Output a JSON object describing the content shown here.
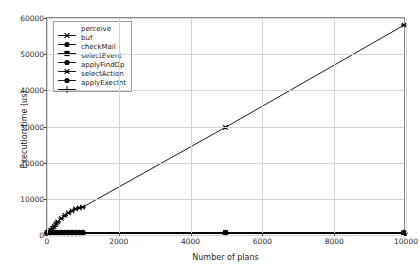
{
  "chart_data": {
    "type": "line",
    "title": "",
    "xlabel": "Number of plans",
    "ylabel": "Execution time (us)",
    "xlim": [
      0,
      10000
    ],
    "ylim": [
      0,
      60000
    ],
    "xticks": [
      0,
      2000,
      4000,
      6000,
      8000,
      10000
    ],
    "yticks": [
      0,
      10000,
      20000,
      30000,
      40000,
      50000,
      60000
    ],
    "xtick_labels": [
      "0",
      "2000",
      "4000",
      "6000",
      "8000",
      "10000"
    ],
    "ytick_labels": [
      "0",
      "10000",
      "20000",
      "30000",
      "40000",
      "50000",
      "60000"
    ],
    "grid": true,
    "legend_position": "upper left",
    "series": [
      {
        "name": "perceive",
        "marker": "star",
        "color": "#000000",
        "x": [
          10,
          50,
          100,
          150,
          200,
          250,
          300,
          400,
          500,
          600,
          700,
          800,
          900,
          1000,
          5000,
          10000
        ],
        "y": [
          50,
          300,
          700,
          1200,
          1800,
          2500,
          3100,
          4100,
          4900,
          5600,
          6200,
          6700,
          7000,
          7200,
          29500,
          58000
        ]
      },
      {
        "name": "buf",
        "marker": "circle",
        "color": "#000000",
        "x": [
          10,
          100,
          200,
          300,
          400,
          500,
          600,
          700,
          800,
          900,
          1000,
          5000,
          10000
        ],
        "y": [
          0,
          0,
          0,
          0,
          0,
          0,
          0,
          0,
          0,
          0,
          0,
          0,
          0
        ]
      },
      {
        "name": "checkMail",
        "marker": "square",
        "color": "#000000",
        "x": [
          10,
          100,
          200,
          300,
          400,
          500,
          600,
          700,
          800,
          900,
          1000,
          5000,
          10000
        ],
        "y": [
          0,
          0,
          0,
          0,
          0,
          0,
          0,
          0,
          0,
          0,
          0,
          0,
          0
        ]
      },
      {
        "name": "selectEvent",
        "marker": "circle",
        "color": "#000000",
        "x": [
          10,
          100,
          200,
          300,
          400,
          500,
          600,
          700,
          800,
          900,
          1000,
          5000,
          10000
        ],
        "y": [
          0,
          0,
          0,
          0,
          0,
          0,
          0,
          0,
          0,
          0,
          0,
          0,
          0
        ]
      },
      {
        "name": "applyFindOp",
        "marker": "star",
        "color": "#000000",
        "x": [
          10,
          100,
          200,
          300,
          400,
          500,
          600,
          700,
          800,
          900,
          1000,
          5000,
          10000
        ],
        "y": [
          0,
          0,
          0,
          0,
          0,
          0,
          0,
          0,
          0,
          0,
          0,
          0,
          0
        ]
      },
      {
        "name": "selectAction",
        "marker": "circle",
        "color": "#000000",
        "x": [
          10,
          100,
          200,
          300,
          400,
          500,
          600,
          700,
          800,
          900,
          1000,
          5000,
          10000
        ],
        "y": [
          0,
          0,
          0,
          0,
          0,
          0,
          0,
          0,
          0,
          0,
          0,
          0,
          0
        ]
      },
      {
        "name": "applyExecInt",
        "marker": "plus",
        "color": "#000000",
        "x": [
          10,
          100,
          200,
          300,
          400,
          500,
          600,
          700,
          800,
          900,
          1000,
          5000,
          10000
        ],
        "y": [
          0,
          0,
          0,
          0,
          0,
          0,
          0,
          0,
          0,
          0,
          0,
          0,
          0
        ]
      }
    ]
  },
  "legend": {
    "items": [
      {
        "label": "perceive",
        "marker": "star"
      },
      {
        "label": "buf",
        "marker": "circle"
      },
      {
        "label": "checkMail",
        "marker": "square"
      },
      {
        "label": "selectEvent",
        "marker": "circle"
      },
      {
        "label": "applyFindOp",
        "marker": "star"
      },
      {
        "label": "selectAction",
        "marker": "circle"
      },
      {
        "label": "applyExecInt",
        "marker": "plus"
      }
    ]
  },
  "colors": {
    "data": "#000000",
    "grid": "#d4d4d4",
    "frame": "#8a8a8a",
    "background": "#ffffff",
    "text": "#1e1e1e"
  }
}
